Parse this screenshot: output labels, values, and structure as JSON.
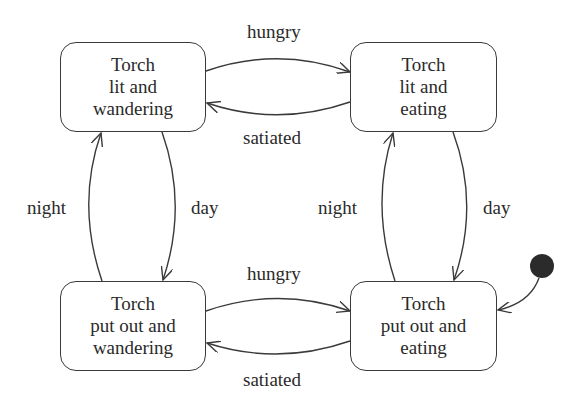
{
  "diagram": {
    "type": "state-machine",
    "colors": {
      "stroke": "#3a3a3a",
      "text": "#2a2a2a",
      "initial_dot": "#2b2b2b",
      "background": "#ffffff"
    },
    "states": [
      {
        "id": "lit-wandering",
        "lines": [
          "Torch",
          "lit and",
          "wandering"
        ]
      },
      {
        "id": "lit-eating",
        "lines": [
          "Torch",
          "lit and",
          "eating"
        ]
      },
      {
        "id": "out-wandering",
        "lines": [
          "Torch",
          "put out and",
          "wandering"
        ]
      },
      {
        "id": "out-eating",
        "lines": [
          "Torch",
          "put out and",
          "eating"
        ]
      }
    ],
    "transitions": [
      {
        "from": "lit-wandering",
        "to": "lit-eating",
        "label": "hungry"
      },
      {
        "from": "lit-eating",
        "to": "lit-wandering",
        "label": "satiated"
      },
      {
        "from": "out-wandering",
        "to": "out-eating",
        "label": "hungry"
      },
      {
        "from": "out-eating",
        "to": "out-wandering",
        "label": "satiated"
      },
      {
        "from": "out-wandering",
        "to": "lit-wandering",
        "label": "night"
      },
      {
        "from": "lit-wandering",
        "to": "out-wandering",
        "label": "day"
      },
      {
        "from": "out-eating",
        "to": "lit-eating",
        "label": "night"
      },
      {
        "from": "lit-eating",
        "to": "out-eating",
        "label": "day"
      }
    ],
    "initial_state": "out-eating",
    "edge_labels": {
      "top_hungry": "hungry",
      "top_satiated": "satiated",
      "bottom_hungry": "hungry",
      "bottom_satiated": "satiated",
      "left_night": "night",
      "left_day": "day",
      "right_night": "night",
      "right_day": "day"
    }
  }
}
